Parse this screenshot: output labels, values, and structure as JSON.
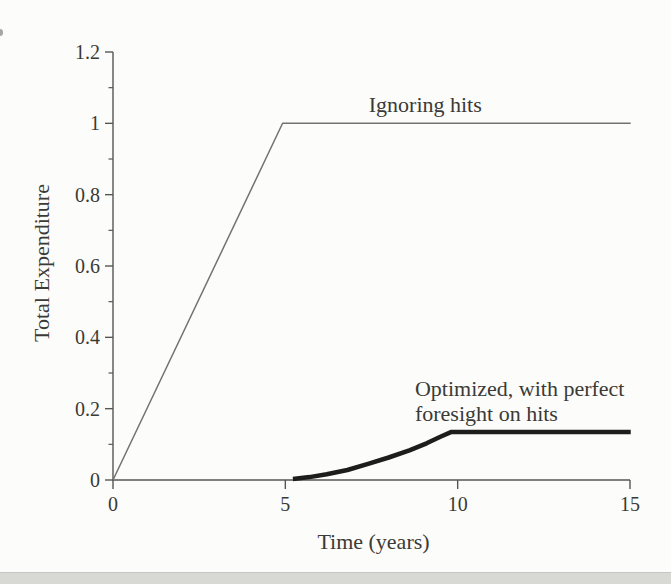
{
  "page": {
    "background": "#fcfcfa",
    "bottom_strip_color": "#d8d8d4"
  },
  "chart_data": {
    "type": "line",
    "title": "",
    "xlabel": "Time (years)",
    "ylabel": "Total Expenditure",
    "xlim": [
      0,
      15
    ],
    "ylim": [
      0,
      1.2
    ],
    "xticks": [
      0,
      5,
      10,
      15
    ],
    "xtick_labels": [
      "0",
      "5",
      "10",
      "15"
    ],
    "yticks": [
      0,
      0.2,
      0.4,
      0.6,
      0.8,
      1,
      1.2
    ],
    "ytick_labels": [
      "0",
      "0.2",
      "0.4",
      "0.6",
      "0.8",
      "1",
      "1.2"
    ],
    "y_minor_ticks": [
      0.1,
      0.3,
      0.5,
      0.7,
      0.9,
      1.1
    ],
    "grid": false,
    "legend_position": "none",
    "axis_color": "#565652",
    "text_color": "#3a3a36",
    "series": [
      {
        "name": "Ignoring hits",
        "style": "thin",
        "color": "#73736e",
        "stroke_width": 1.5,
        "points": [
          [
            0,
            0
          ],
          [
            4.92,
            1.0
          ],
          [
            15.02,
            1.0
          ]
        ]
      },
      {
        "name": "Optimized, with perfect foresight on hits",
        "style": "thick",
        "color": "#1d1d1b",
        "stroke_width": 4.5,
        "points": [
          [
            5.22,
            0.003
          ],
          [
            5.7,
            0.008
          ],
          [
            6.2,
            0.016
          ],
          [
            6.8,
            0.028
          ],
          [
            7.4,
            0.045
          ],
          [
            8.0,
            0.063
          ],
          [
            8.6,
            0.083
          ],
          [
            9.1,
            0.103
          ],
          [
            9.5,
            0.121
          ],
          [
            9.82,
            0.135
          ],
          [
            15.02,
            0.135
          ]
        ]
      }
    ],
    "annotations": [
      {
        "id": "ignoring-hits",
        "text": "Ignoring hits",
        "x": 9.06,
        "y": 1.031,
        "anchor": "middle"
      },
      {
        "id": "optimized-line1",
        "text": "Optimized, with perfect",
        "x": 8.76,
        "y": 0.2355,
        "anchor": "start"
      },
      {
        "id": "optimized-line2",
        "text": "foresight on hits",
        "x": 8.76,
        "y": 0.1654,
        "anchor": "start"
      }
    ]
  }
}
